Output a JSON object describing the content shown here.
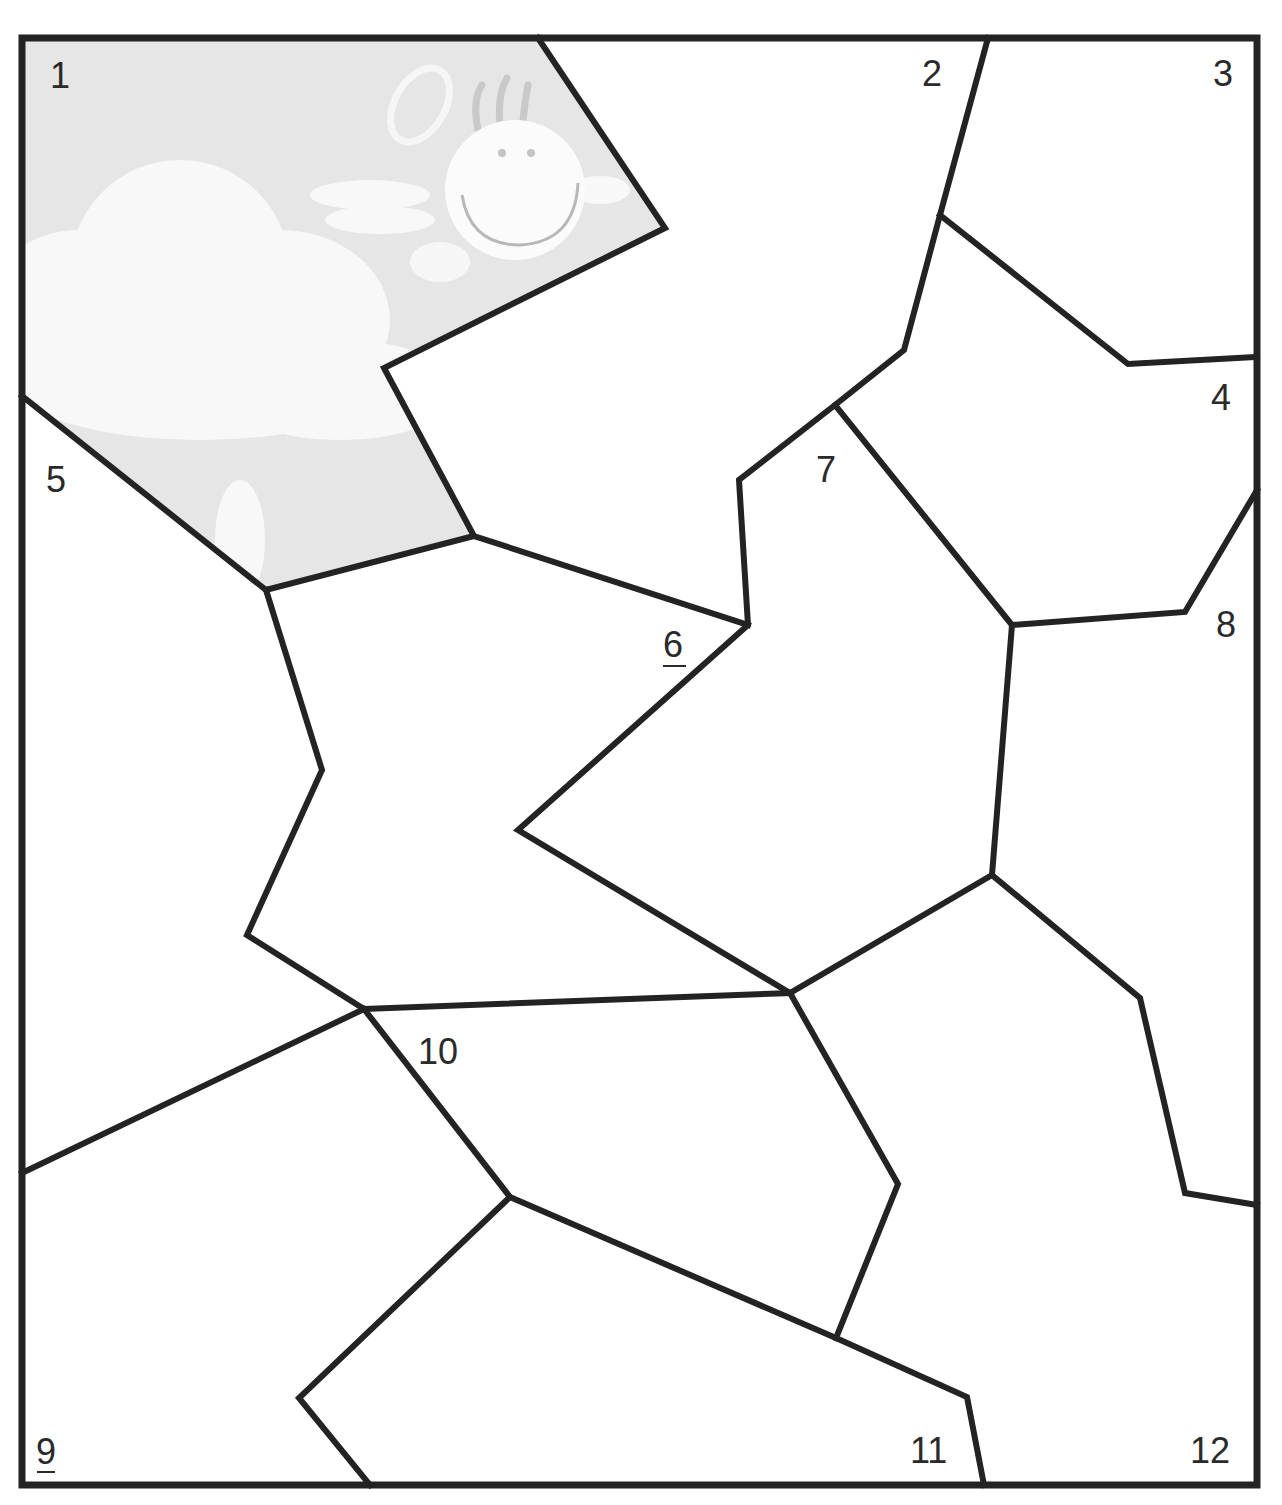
{
  "diagram": {
    "type": "numbered-puzzle-pieces",
    "piece_count": 12,
    "revealed_piece": "1",
    "revealed_image": "angel-smiley-clouds",
    "colors": {
      "line": "#232323",
      "revealed_fill": "#e6e6e6",
      "cloud": "#f7f7f7",
      "background": "#ffffff"
    },
    "pieces": [
      {
        "id": "1",
        "label": "1",
        "underlined": false
      },
      {
        "id": "2",
        "label": "2",
        "underlined": false
      },
      {
        "id": "3",
        "label": "3",
        "underlined": false
      },
      {
        "id": "4",
        "label": "4",
        "underlined": false
      },
      {
        "id": "5",
        "label": "5",
        "underlined": false
      },
      {
        "id": "6",
        "label": "6",
        "underlined": true
      },
      {
        "id": "7",
        "label": "7",
        "underlined": false
      },
      {
        "id": "8",
        "label": "8",
        "underlined": false
      },
      {
        "id": "9",
        "label": "9",
        "underlined": true
      },
      {
        "id": "10",
        "label": "10",
        "underlined": false
      },
      {
        "id": "11",
        "label": "11",
        "underlined": false
      },
      {
        "id": "12",
        "label": "12",
        "underlined": false
      }
    ]
  }
}
